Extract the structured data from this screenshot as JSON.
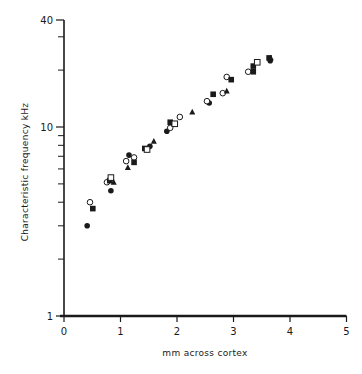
{
  "chart_data": {
    "type": "scatter",
    "title": "",
    "xlabel": "mm across cortex",
    "ylabel": "Characteristic  frequency  kHz",
    "xlim": [
      0,
      5
    ],
    "ylim": [
      1,
      40
    ],
    "yscale": "log",
    "grid": false,
    "legend": null,
    "x_ticks": [
      0,
      1,
      2,
      3,
      4,
      5
    ],
    "y_tick_labels": [
      {
        "value": 1,
        "label": "1"
      },
      {
        "value": 10,
        "label": "10"
      },
      {
        "value": 40,
        "label": "40"
      }
    ],
    "y_minor_ticks": [
      2,
      3,
      4,
      5,
      6,
      7,
      8,
      9,
      20,
      30
    ],
    "series": [
      {
        "name": "filled-circle",
        "marker": "filled-circle",
        "points": [
          [
            0.41,
            3.0
          ],
          [
            0.83,
            4.6
          ],
          [
            1.15,
            7.1
          ],
          [
            1.52,
            7.9
          ],
          [
            1.82,
            9.5
          ],
          [
            2.57,
            13.4
          ],
          [
            3.65,
            22.4
          ]
        ]
      },
      {
        "name": "open-circle",
        "marker": "open-circle",
        "points": [
          [
            0.46,
            4.0
          ],
          [
            0.76,
            5.1
          ],
          [
            1.1,
            6.6
          ],
          [
            1.24,
            6.9
          ],
          [
            1.88,
            9.9
          ],
          [
            2.05,
            11.3
          ],
          [
            2.53,
            13.7
          ],
          [
            2.81,
            15.1
          ],
          [
            2.88,
            18.4
          ],
          [
            3.26,
            19.6
          ]
        ]
      },
      {
        "name": "filled-square",
        "marker": "filled-square",
        "points": [
          [
            0.51,
            3.7
          ],
          [
            0.81,
            5.2
          ],
          [
            1.24,
            6.5
          ],
          [
            1.43,
            7.7
          ],
          [
            1.88,
            10.6
          ],
          [
            2.64,
            14.9
          ],
          [
            2.96,
            17.8
          ],
          [
            3.35,
            21.0
          ],
          [
            3.35,
            19.6
          ],
          [
            3.63,
            23.2
          ]
        ]
      },
      {
        "name": "open-square",
        "marker": "open-square",
        "points": [
          [
            0.83,
            5.4
          ],
          [
            1.47,
            7.6
          ],
          [
            1.96,
            10.4
          ],
          [
            3.42,
            22.0
          ]
        ]
      },
      {
        "name": "filled-triangle",
        "marker": "filled-triangle",
        "points": [
          [
            0.88,
            5.1
          ],
          [
            1.13,
            6.1
          ],
          [
            1.59,
            8.4
          ],
          [
            2.27,
            12.0
          ],
          [
            2.88,
            15.5
          ],
          [
            3.66,
            23.2
          ]
        ]
      }
    ]
  }
}
